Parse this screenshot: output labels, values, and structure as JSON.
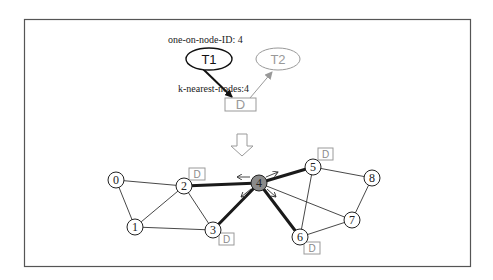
{
  "diagram": {
    "type": "task-placement-graph",
    "top_section": {
      "annotation_one_on_node": "one-on-node-ID: 4",
      "annotation_k_nearest": "k-nearest-nodes:4",
      "tasks": [
        {
          "id": "T1",
          "label": "T1",
          "color": "#111111"
        },
        {
          "id": "T2",
          "label": "T2",
          "color": "#999999"
        }
      ],
      "data_box": {
        "label": "D",
        "color": "#999999"
      },
      "edges": [
        {
          "from": "T1",
          "to": "D",
          "style": "thick-dark"
        },
        {
          "from": "D",
          "to": "T2",
          "style": "thin-gray"
        }
      ]
    },
    "transition_arrow": "down-hollow-arrow",
    "graph": {
      "nodes": [
        {
          "id": "0",
          "label": "0",
          "x": 116,
          "y": 180,
          "highlighted": false
        },
        {
          "id": "1",
          "label": "1",
          "x": 135,
          "y": 227,
          "highlighted": false
        },
        {
          "id": "2",
          "label": "2",
          "x": 184,
          "y": 186,
          "highlighted": false
        },
        {
          "id": "3",
          "label": "3",
          "x": 213,
          "y": 230,
          "highlighted": false
        },
        {
          "id": "4",
          "label": "4",
          "x": 259,
          "y": 183,
          "highlighted": true,
          "fill": "#8a8a8a"
        },
        {
          "id": "5",
          "label": "5",
          "x": 313,
          "y": 167,
          "highlighted": false
        },
        {
          "id": "6",
          "label": "6",
          "x": 300,
          "y": 237,
          "highlighted": false
        },
        {
          "id": "7",
          "label": "7",
          "x": 352,
          "y": 220,
          "highlighted": false
        },
        {
          "id": "8",
          "label": "8",
          "x": 372,
          "y": 178,
          "highlighted": false
        }
      ],
      "edges": [
        {
          "from": "0",
          "to": "2",
          "thick": false
        },
        {
          "from": "0",
          "to": "1",
          "thick": false
        },
        {
          "from": "1",
          "to": "2",
          "thick": false
        },
        {
          "from": "1",
          "to": "3",
          "thick": false
        },
        {
          "from": "2",
          "to": "3",
          "thick": false
        },
        {
          "from": "2",
          "to": "4",
          "thick": true
        },
        {
          "from": "3",
          "to": "4",
          "thick": true
        },
        {
          "from": "4",
          "to": "5",
          "thick": true
        },
        {
          "from": "4",
          "to": "6",
          "thick": true
        },
        {
          "from": "4",
          "to": "7",
          "thick": false
        },
        {
          "from": "5",
          "to": "6",
          "thick": false
        },
        {
          "from": "5",
          "to": "8",
          "thick": false
        },
        {
          "from": "6",
          "to": "7",
          "thick": false
        },
        {
          "from": "7",
          "to": "8",
          "thick": false
        }
      ],
      "data_replicas": [
        {
          "node": "2",
          "label": "D"
        },
        {
          "node": "3",
          "label": "D"
        },
        {
          "node": "5",
          "label": "D"
        },
        {
          "node": "6",
          "label": "D"
        }
      ],
      "movement_arrows_on_node": "4",
      "movement_arrow_count": 4
    }
  }
}
